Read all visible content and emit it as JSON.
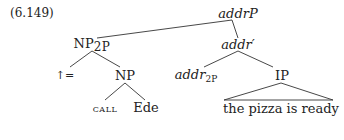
{
  "example_number": "(6.149)",
  "tree": {
    "root": {
      "label": "addr",
      "suffix": "P"
    },
    "np2p": {
      "label": "NP",
      "sub": "2P"
    },
    "addr_bar": {
      "label": "addr′"
    },
    "up_eq": {
      "label": "↑="
    },
    "np": {
      "label": "NP"
    },
    "addr2p": {
      "label": "addr",
      "sub": "2P"
    },
    "ip": {
      "label": "IP"
    },
    "call": {
      "label": "call"
    },
    "ede": {
      "label": "Ede"
    },
    "ip_yield": {
      "label": "the pizza is ready"
    }
  }
}
